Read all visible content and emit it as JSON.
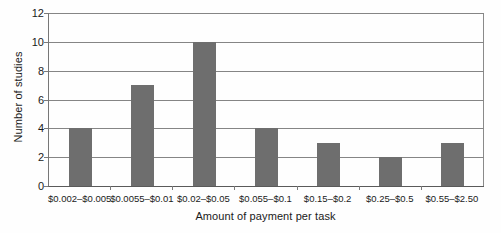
{
  "chart_data": {
    "type": "bar",
    "title": "",
    "subtitle": "",
    "xlabel": "Amount of payment per task",
    "ylabel": "Number of studies",
    "categories": [
      "$0.002–$0.005",
      "$0.0055–$0.01",
      "$0.02–$0.05",
      "$0.055–$0.1",
      "$0.15–$0.2",
      "$0.25–$0.5",
      "$0.55–$2.50"
    ],
    "values": [
      4,
      7,
      10,
      4,
      3,
      2,
      3
    ],
    "ylim": [
      0,
      12
    ],
    "ytick_values": [
      0,
      2,
      4,
      6,
      8,
      10,
      12
    ],
    "ytick_labels": [
      "0",
      "2",
      "4",
      "6",
      "8",
      "10",
      "12"
    ],
    "grid": true,
    "grid_axis": "y",
    "legend": false,
    "legend_position": "none",
    "annotations": [],
    "colors": {
      "bar_fill": "#6e6e6e",
      "gridline": "#858585",
      "axis_line": "#5a5a5a",
      "frame_line": "#8a8a8a",
      "background": "#fefefe",
      "text": "#1a1a1a"
    }
  }
}
